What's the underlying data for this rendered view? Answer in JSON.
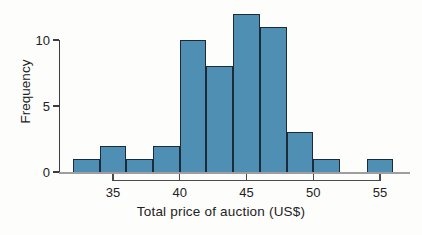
{
  "figure": {
    "background": "#fdfdfc"
  },
  "chart_data": {
    "type": "bar",
    "subtype": "histogram",
    "title": "",
    "xlabel": "Total price of auction (US$)",
    "ylabel": "Frequency",
    "bin_edges": [
      32,
      34,
      36,
      38,
      40,
      42,
      44,
      46,
      48,
      50,
      52,
      54,
      56
    ],
    "values": [
      1,
      2,
      1,
      2,
      10,
      8,
      12,
      11,
      3,
      1,
      0,
      1
    ],
    "xticks": [
      35,
      40,
      45,
      50,
      55
    ],
    "yticks": [
      0,
      5,
      10
    ],
    "xlim": [
      32,
      56
    ],
    "ylim": [
      0,
      12.5
    ],
    "grid": false,
    "legend": null,
    "colors": {
      "bar_fill": "#4e8fb3",
      "bar_border": "#1d2a38",
      "y_axis_line": "#3c3c3c",
      "x_axis_line": "#4a4a4a",
      "baseline": "#9e9e9e",
      "text": "#222222"
    }
  }
}
